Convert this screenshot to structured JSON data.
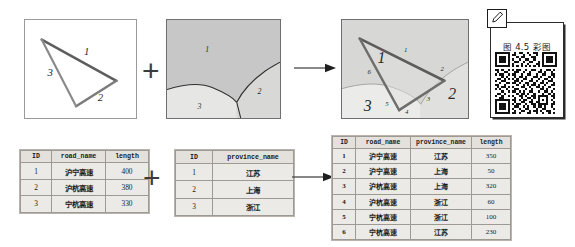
{
  "figure": {
    "caption": "图 4.5 彩图",
    "qr_alt": "qr-code",
    "operators": {
      "plus": "+",
      "arrow": "→"
    }
  },
  "maps": {
    "line_layer": {
      "name": "road-line-layer",
      "edge_labels": [
        "1",
        "2",
        "3"
      ]
    },
    "polygon_layer": {
      "name": "province-polygon-layer",
      "region_labels": [
        "1",
        "2",
        "3"
      ]
    },
    "overlay_result": {
      "name": "overlay-result-layer",
      "segment_labels": [
        "1",
        "2",
        "3",
        "4",
        "5",
        "6"
      ],
      "region_labels": [
        "1",
        "2",
        "3"
      ]
    }
  },
  "tables": {
    "roads": {
      "title": "road-table",
      "columns": [
        "ID",
        "road_name",
        "length"
      ],
      "rows": [
        [
          "1",
          "沪宁高速",
          "400"
        ],
        [
          "2",
          "沪杭高速",
          "380"
        ],
        [
          "3",
          "宁杭高速",
          "330"
        ]
      ]
    },
    "provinces": {
      "title": "province-table",
      "columns": [
        "ID",
        "province_name"
      ],
      "rows": [
        [
          "1",
          "江苏"
        ],
        [
          "2",
          "上海"
        ],
        [
          "3",
          "浙江"
        ]
      ]
    },
    "result": {
      "title": "overlay-result-table",
      "columns": [
        "ID",
        "road_name",
        "province_name",
        "length"
      ],
      "rows": [
        [
          "1",
          "沪宁高速",
          "江苏",
          "350"
        ],
        [
          "2",
          "沪宁高速",
          "上海",
          "50"
        ],
        [
          "3",
          "沪杭高速",
          "上海",
          "320"
        ],
        [
          "4",
          "沪杭高速",
          "浙江",
          "60"
        ],
        [
          "5",
          "宁杭高速",
          "浙江",
          "100"
        ],
        [
          "6",
          "宁杭高速",
          "江苏",
          "230"
        ]
      ]
    }
  },
  "colors": {
    "line_stroke": "#6b6b6b",
    "polygon_dark": "#c9c9c9",
    "polygon_light": "#e3e3e1",
    "table_fill": "#eceae6",
    "border": "#9d9a94"
  }
}
